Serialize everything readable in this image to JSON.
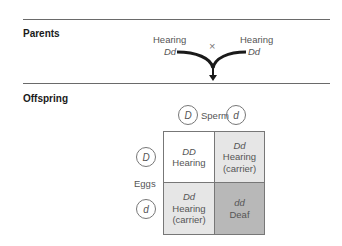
{
  "sections": {
    "parents_label": "Parents",
    "offspring_label": "Offspring"
  },
  "parents": {
    "left": {
      "phenotype": "Hearing",
      "genotype": "Dd"
    },
    "right": {
      "phenotype": "Hearing",
      "genotype": "Dd"
    },
    "cross_symbol": "×"
  },
  "punnett": {
    "sperm_label": "Sperm",
    "eggs_label": "Eggs",
    "sperm_alleles": [
      "D",
      "d"
    ],
    "egg_alleles": [
      "D",
      "d"
    ],
    "cells": [
      {
        "genotype": "DD",
        "line1": "Hearing",
        "line2": "",
        "color": "#ffffff"
      },
      {
        "genotype": "Dd",
        "line1": "Hearing",
        "line2": "(carrier)",
        "color": "#e6e6e6"
      },
      {
        "genotype": "Dd",
        "line1": "Hearing",
        "line2": "(carrier)",
        "color": "#e6e6e6"
      },
      {
        "genotype": "dd",
        "line1": "Deaf",
        "line2": "",
        "color": "#b8b8b8"
      }
    ]
  }
}
